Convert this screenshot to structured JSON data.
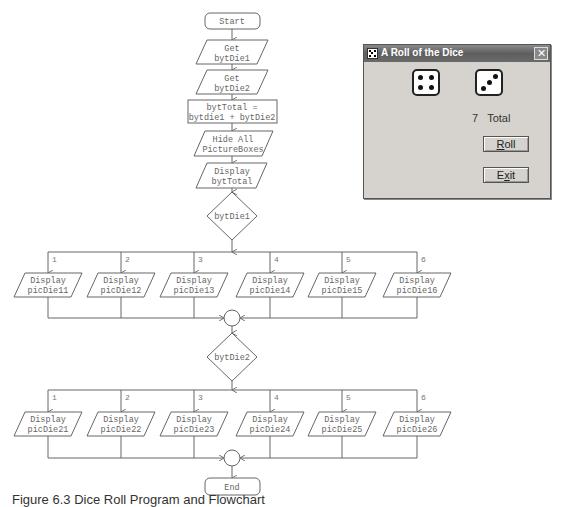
{
  "flowchart": {
    "start": "Start",
    "end": "End",
    "steps": [
      {
        "line1": "Get",
        "line2": "bytDie1"
      },
      {
        "line1": "Get",
        "line2": "bytDie2"
      },
      {
        "line1": "bytTotal =",
        "line2": "bytdie1 + bytDie2"
      },
      {
        "line1": "Hide All",
        "line2": "PictureBoxes"
      },
      {
        "line1": "Display",
        "line2": "bytTotal"
      }
    ],
    "decision1": "bytDie1",
    "decision2": "bytDie2",
    "case_labels": [
      "1",
      "2",
      "3",
      "4",
      "5",
      "6"
    ],
    "row1": [
      {
        "line1": "Display",
        "line2": "picDie11"
      },
      {
        "line1": "Display",
        "line2": "picDie12"
      },
      {
        "line1": "Display",
        "line2": "picDie13"
      },
      {
        "line1": "Display",
        "line2": "picDie14"
      },
      {
        "line1": "Display",
        "line2": "picDie15"
      },
      {
        "line1": "Display",
        "line2": "picDie16"
      }
    ],
    "row2": [
      {
        "line1": "Display",
        "line2": "picDie21"
      },
      {
        "line1": "Display",
        "line2": "picDie22"
      },
      {
        "line1": "Display",
        "line2": "picDie23"
      },
      {
        "line1": "Display",
        "line2": "picDie24"
      },
      {
        "line1": "Display",
        "line2": "picDie25"
      },
      {
        "line1": "Display",
        "line2": "picDie26"
      }
    ]
  },
  "dialog": {
    "title": "A Roll of the Dice",
    "close_icon": "close-icon",
    "die1_value": 4,
    "die2_value": 3,
    "total_value": "7",
    "total_label": "Total",
    "roll_button": {
      "prefix": "",
      "mnemonic": "R",
      "suffix": "oll"
    },
    "exit_button": {
      "prefix": "E",
      "mnemonic": "x",
      "suffix": "it"
    }
  },
  "caption": "Figure 6.3        Dice Roll Program and Flowchart"
}
